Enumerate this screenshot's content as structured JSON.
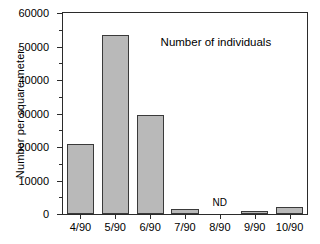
{
  "chart_data": {
    "type": "bar",
    "title": "",
    "annotation": "Number of individuals",
    "xlabel": "",
    "ylabel": "Number per square meter",
    "categories": [
      "4/90",
      "5/90",
      "6/90",
      "7/90",
      "8/90",
      "9/90",
      "10/90"
    ],
    "values": [
      21000,
      53500,
      29500,
      1500,
      null,
      800,
      2100
    ],
    "value_labels": [
      "",
      "",
      "",
      "",
      "ND",
      "",
      ""
    ],
    "no_data_categories": [
      "8/90"
    ],
    "no_data_marker": "ND",
    "ylim": [
      0,
      60000
    ],
    "xlim_categories": 7,
    "ytick_major": [
      0,
      10000,
      20000,
      30000,
      40000,
      50000,
      60000
    ],
    "ytick_major_labels": [
      "0",
      "10000",
      "20000",
      "30000",
      "40000",
      "50000",
      "60000"
    ],
    "ytick_minor": [
      5000,
      15000,
      25000,
      35000,
      45000,
      55000
    ],
    "grid": false,
    "legend": false,
    "bar_fill_color": "#b9b9b9",
    "bar_edge_color": "#3a3a3a",
    "axis_color": "#2b2b2b",
    "background_color": "#ffffff"
  }
}
